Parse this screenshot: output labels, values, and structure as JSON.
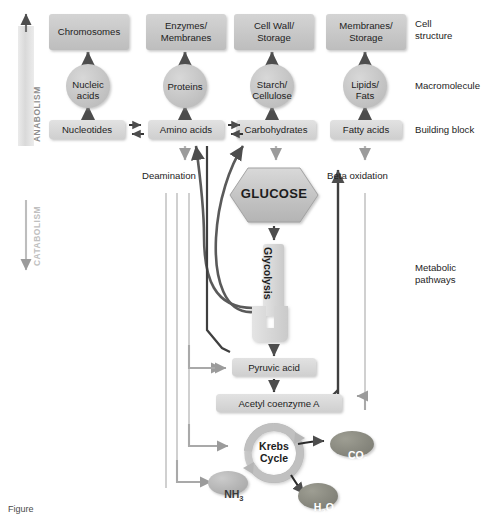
{
  "figure": {
    "caption": "Figure"
  },
  "axis_labels": {
    "anabolism": "ANABOLISM",
    "catabolism": "CATABOLISM"
  },
  "row_labels": [
    {
      "id": "cell-structure",
      "line1": "Cell",
      "line2": "structure"
    },
    {
      "id": "macromolecule",
      "line1": "Macromolecule",
      "line2": ""
    },
    {
      "id": "building-block",
      "line1": "Building block",
      "line2": ""
    },
    {
      "id": "metabolic-pathways",
      "line1": "Metabolic",
      "line2": "pathways"
    }
  ],
  "cell_structures": [
    {
      "id": "chromosomes",
      "line1": "Chromosomes",
      "line2": ""
    },
    {
      "id": "enzymes-membranes",
      "line1": "Enzymes/",
      "line2": "Membranes"
    },
    {
      "id": "cell-wall-storage",
      "line1": "Cell Wall/",
      "line2": "Storage"
    },
    {
      "id": "membranes-storage",
      "line1": "Membranes/",
      "line2": "Storage"
    }
  ],
  "macromolecules": [
    {
      "id": "nucleic-acids",
      "line1": "Nucleic",
      "line2": "acids"
    },
    {
      "id": "proteins",
      "line1": "Proteins",
      "line2": ""
    },
    {
      "id": "starch-cellulose",
      "line1": "Starch/",
      "line2": "Cellulose"
    },
    {
      "id": "lipids-fats",
      "line1": "Lipids/",
      "line2": "Fats"
    }
  ],
  "building_blocks": [
    {
      "id": "nucleotides",
      "label": "Nucleotides"
    },
    {
      "id": "amino-acids",
      "label": "Amino acids"
    },
    {
      "id": "carbohydrates",
      "label": "Carbohydrates"
    },
    {
      "id": "fatty-acids",
      "label": "Fatty acids"
    }
  ],
  "pathways": {
    "deamination": "Deamination",
    "beta_oxidation": "Beta oxidation",
    "glucose": "GLUCOSE",
    "glycolysis": "Glycolysis",
    "pyruvic_acid": "Pyruvic acid",
    "acetyl_coenzyme_a": "Acetyl coenzyme A",
    "krebs_line1": "Krebs",
    "krebs_line2": "Cycle"
  },
  "products": [
    {
      "id": "co2",
      "main": "CO",
      "sub": "2"
    },
    {
      "id": "h2o",
      "main": "H",
      "sub": "2",
      "tail": "O"
    },
    {
      "id": "nh3",
      "main": "NH",
      "sub": "3"
    }
  ],
  "colors": {
    "box_fill": "#c9c9c9",
    "box_fill_light": "#d6d6d6",
    "circle_fill": "#c6c6c6",
    "hexagon_fill": "#c2c2c2",
    "dark_arrow": "#4d4d4d",
    "light_arrow": "#9b9b9b",
    "ring": "#b2b2b2",
    "product_dark": "#8d8d85",
    "product_light": "#b8b8b8",
    "band": "#dcdcdc",
    "text": "#1d1d1d"
  }
}
